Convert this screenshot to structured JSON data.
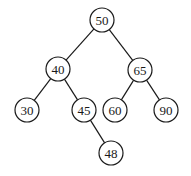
{
  "diagram": {
    "type": "binary-search-tree",
    "nodes": [
      {
        "id": "n50",
        "label": "50",
        "x": 102,
        "y": 20
      },
      {
        "id": "n40",
        "label": "40",
        "x": 58,
        "y": 69
      },
      {
        "id": "n65",
        "label": "65",
        "x": 140,
        "y": 70
      },
      {
        "id": "n30",
        "label": "30",
        "x": 27,
        "y": 110
      },
      {
        "id": "n45",
        "label": "45",
        "x": 84,
        "y": 110
      },
      {
        "id": "n60",
        "label": "60",
        "x": 115,
        "y": 110
      },
      {
        "id": "n90",
        "label": "90",
        "x": 166,
        "y": 110
      },
      {
        "id": "n48",
        "label": "48",
        "x": 111,
        "y": 153
      }
    ],
    "edges": [
      {
        "from": "n50",
        "to": "n40"
      },
      {
        "from": "n50",
        "to": "n65"
      },
      {
        "from": "n40",
        "to": "n30"
      },
      {
        "from": "n40",
        "to": "n45"
      },
      {
        "from": "n65",
        "to": "n60"
      },
      {
        "from": "n65",
        "to": "n90"
      },
      {
        "from": "n45",
        "to": "n48"
      }
    ],
    "node_radius": 12,
    "colors": {
      "stroke": "#1a1a1a",
      "fill": "#ffffff",
      "text": "#1a1a1a"
    }
  }
}
